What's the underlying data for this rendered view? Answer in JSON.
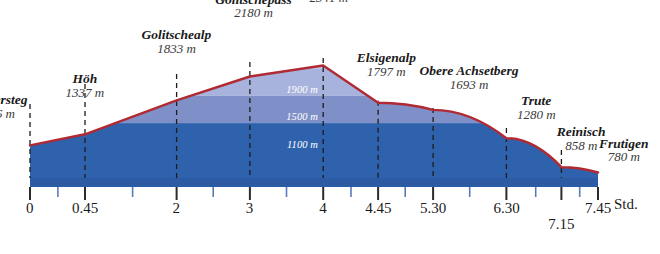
{
  "chart_data": {
    "type": "area",
    "title": "",
    "subtitle": "",
    "xlabel": "Std.",
    "ylabel": "",
    "xlim": [
      0,
      7.75
    ],
    "ylim": [
      700,
      2450
    ],
    "grid": true,
    "legend_position": "none",
    "x_unit_label": "Std.",
    "x_tick_labels": [
      "0",
      "0.45",
      "2",
      "3",
      "4",
      "4.45",
      "5.30",
      "6.30",
      "7.15",
      "7.45"
    ],
    "x_tick_values": [
      0,
      0.75,
      2,
      3,
      4,
      4.75,
      5.5,
      6.5,
      7.25,
      7.75
    ],
    "x_minor_ticks": [
      0.38,
      1.4,
      2.5,
      3.5,
      4.38,
      5.12,
      6.0,
      6.9,
      7.5
    ],
    "elevation_bands": [
      {
        "label": "2300 m",
        "value": 2300
      },
      {
        "label": "1900 m",
        "value": 1900
      },
      {
        "label": "1500 m",
        "value": 1500
      },
      {
        "label": "1100 m",
        "value": 1100
      }
    ],
    "categories": [
      "Kandersteg",
      "Höh",
      "Golitschealp",
      "Golitschepass",
      "Elsighorn",
      "Elsigenalp",
      "Obere Achsetberg",
      "Trute",
      "Reinisch",
      "Frutigen"
    ],
    "values": [
      1176,
      1337,
      1833,
      2180,
      2341,
      1797,
      1693,
      1280,
      858,
      780
    ],
    "points": [
      {
        "name": "Kandersteg",
        "elevation": "1176 m",
        "elev_value": 1176,
        "time": "0",
        "time_value": 0.0
      },
      {
        "name": "Höh",
        "elevation": "1337 m",
        "elev_value": 1337,
        "time": "0.45",
        "time_value": 0.75
      },
      {
        "name": "Golitschealp",
        "elevation": "1833 m",
        "elev_value": 1833,
        "time": "2",
        "time_value": 2.0
      },
      {
        "name": "Golitschepass",
        "elevation": "2180 m",
        "elev_value": 2180,
        "time": "3",
        "time_value": 3.0
      },
      {
        "name": "Elsighorn",
        "elevation": "2341 m",
        "elev_value": 2341,
        "time": "4",
        "time_value": 4.0
      },
      {
        "name": "Elsigenalp",
        "elevation": "1797 m",
        "elev_value": 1797,
        "time": "4.45",
        "time_value": 4.75
      },
      {
        "name": "Obere Achsetberg",
        "elevation": "1693 m",
        "elev_value": 1693,
        "time": "5.30",
        "time_value": 5.5
      },
      {
        "name": "Trute",
        "elevation": "1280 m",
        "elev_value": 1280,
        "time": "6.30",
        "time_value": 6.5
      },
      {
        "name": "Reinisch",
        "elevation": "858 m",
        "elev_value": 858,
        "time": "7.15",
        "time_value": 7.25
      },
      {
        "name": "Frutigen",
        "elevation": "780 m",
        "elev_value": 780,
        "time": "7.45",
        "time_value": 7.75
      }
    ],
    "colors": {
      "profile_line": "#b02a33",
      "band_top": "#c5cbe6",
      "band_2": "#a8b3dd",
      "band_3": "#7f90c8",
      "band_bottom": "#2f62ad",
      "axis_bar": "#2c5ba4",
      "tick_major": "#2b2b2b",
      "tick_minor": "#5d79bb",
      "band_text": "#ffffff",
      "label_text": "#1a1a1a",
      "background": "#ffffff"
    }
  }
}
